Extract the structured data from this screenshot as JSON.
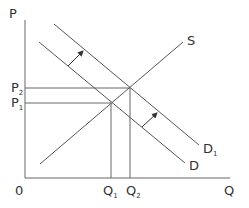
{
  "diagram": {
    "type": "supply-demand",
    "axes": {
      "y_label": "P",
      "x_label": "Q",
      "origin_label": "0"
    },
    "price_levels": [
      {
        "main": "P",
        "sub": "2"
      },
      {
        "main": "P",
        "sub": "1"
      }
    ],
    "quantity_levels": [
      {
        "main": "Q",
        "sub": "1"
      },
      {
        "main": "Q",
        "sub": "2"
      }
    ],
    "curves": {
      "supply": {
        "label": "S"
      },
      "demand": {
        "label": "D"
      },
      "demand_shifted": {
        "main": "D",
        "sub": "1"
      }
    },
    "colors": {
      "line": "#555555",
      "text": "#333333",
      "background": "#ffffff"
    }
  }
}
